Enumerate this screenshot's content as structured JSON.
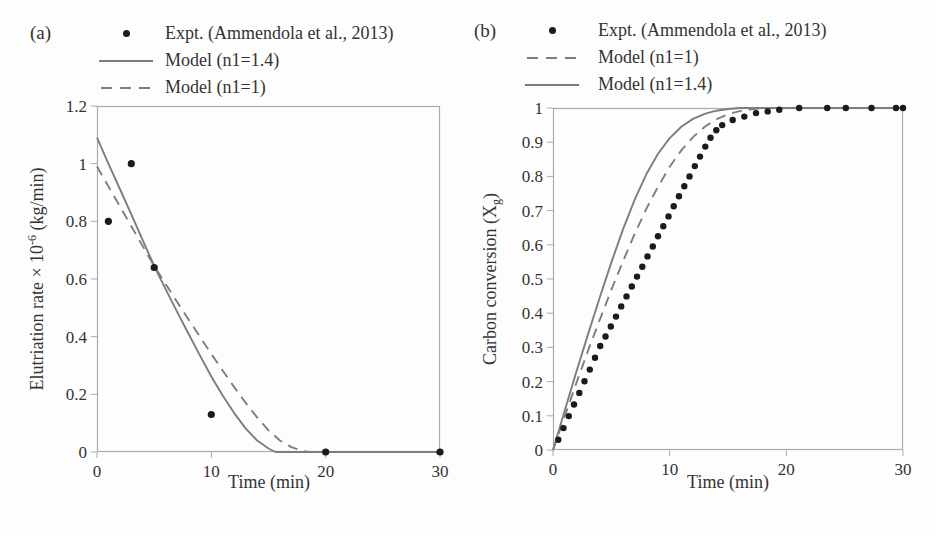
{
  "colors": {
    "model_line_gray": "#7d7d7d",
    "frame_gray": "#ababab",
    "dot_black": "#1b1b1b",
    "text": "#333333",
    "background": "#fdfdfd"
  },
  "panels": [
    {
      "tag": "(a)",
      "xlabel": "Time (min)",
      "ylabel_pre": "Elutriation rate × 10",
      "ylabel_sup": "-6",
      "ylabel_post": " (kg/min)",
      "legend": [
        "Expt. (Ammendola et al., 2013)",
        "Model (n1=1.4)",
        "Model (n1=1)"
      ]
    },
    {
      "tag": "(b)",
      "xlabel": "Time (min)",
      "ylabel_pre": "Carbon conversion (X",
      "ylabel_sub": "g",
      "ylabel_post": ")",
      "legend": [
        "Expt. (Ammendola et al., 2013)",
        "Model (n1=1)",
        "Model (n1=1.4)"
      ]
    }
  ],
  "chart_data": [
    {
      "type": "line",
      "panel": "(a)",
      "xlabel": "Time (min)",
      "ylabel": "Elutriation rate × 10⁻⁶ (kg/min)",
      "xlim": [
        0,
        30
      ],
      "ylim": [
        0,
        1.2
      ],
      "xticks": [
        0,
        10,
        20,
        30
      ],
      "yticks": [
        0,
        0.2,
        0.4,
        0.6,
        0.8,
        1,
        1.2
      ],
      "grid": false,
      "legend_position": "above-top-left",
      "series": [
        {
          "name": "Expt. (Ammendola et al., 2013)",
          "style": "scatter",
          "color": "#1b1b1b",
          "marker_radius": 3.6,
          "points": [
            [
              1,
              0.8
            ],
            [
              3,
              1.0
            ],
            [
              5,
              0.64
            ],
            [
              10,
              0.13
            ],
            [
              20,
              0
            ],
            [
              30,
              0
            ]
          ]
        },
        {
          "name": "Model (n1=1.4)",
          "style": "solid",
          "color": "#7d7d7d",
          "points": [
            [
              0,
              1.09
            ],
            [
              1,
              1.0
            ],
            [
              2,
              0.912
            ],
            [
              3,
              0.824
            ],
            [
              4,
              0.735
            ],
            [
              5,
              0.645
            ],
            [
              6,
              0.565
            ],
            [
              7,
              0.487
            ],
            [
              8,
              0.41
            ],
            [
              9,
              0.335
            ],
            [
              10,
              0.262
            ],
            [
              11,
              0.195
            ],
            [
              12,
              0.135
            ],
            [
              13,
              0.082
            ],
            [
              14,
              0.04
            ],
            [
              15,
              0.012
            ],
            [
              15.6,
              0
            ],
            [
              30,
              0
            ]
          ]
        },
        {
          "name": "Model (n1=1)",
          "style": "dashed",
          "color": "#7d7d7d",
          "points": [
            [
              0,
              0.99
            ],
            [
              1,
              0.921
            ],
            [
              2,
              0.852
            ],
            [
              3,
              0.783
            ],
            [
              4,
              0.714
            ],
            [
              5,
              0.645
            ],
            [
              6,
              0.583
            ],
            [
              7,
              0.521
            ],
            [
              8,
              0.46
            ],
            [
              9,
              0.4
            ],
            [
              10,
              0.34
            ],
            [
              11,
              0.282
            ],
            [
              12,
              0.225
            ],
            [
              13,
              0.171
            ],
            [
              14,
              0.12
            ],
            [
              15,
              0.075
            ],
            [
              16,
              0.04
            ],
            [
              17,
              0.017
            ],
            [
              18,
              0.004
            ],
            [
              18.5,
              0
            ],
            [
              30,
              0
            ]
          ]
        }
      ]
    },
    {
      "type": "line",
      "panel": "(b)",
      "xlabel": "Time (min)",
      "ylabel": "Carbon conversion (Xg)",
      "xlim": [
        0,
        30
      ],
      "ylim": [
        0,
        1
      ],
      "xticks": [
        0,
        10,
        20,
        30
      ],
      "yticks": [
        0,
        0.1,
        0.2,
        0.3,
        0.4,
        0.5,
        0.6,
        0.7,
        0.8,
        0.9,
        1
      ],
      "grid": false,
      "legend_position": "above-top-left",
      "series": [
        {
          "name": "Expt. (Ammendola et al., 2013)",
          "style": "scatter",
          "color": "#1b1b1b",
          "marker_radius": 3.2,
          "points": [
            [
              0.45,
              0.03
            ],
            [
              0.9,
              0.064
            ],
            [
              1.35,
              0.099
            ],
            [
              1.8,
              0.133
            ],
            [
              2.25,
              0.167
            ],
            [
              2.7,
              0.201
            ],
            [
              3.15,
              0.235
            ],
            [
              3.6,
              0.27
            ],
            [
              4.05,
              0.304
            ],
            [
              4.5,
              0.332
            ],
            [
              4.95,
              0.361
            ],
            [
              5.4,
              0.39
            ],
            [
              5.85,
              0.42
            ],
            [
              6.3,
              0.449
            ],
            [
              6.75,
              0.478
            ],
            [
              7.2,
              0.507
            ],
            [
              7.65,
              0.536
            ],
            [
              8.1,
              0.566
            ],
            [
              8.55,
              0.595
            ],
            [
              9,
              0.625
            ],
            [
              9.45,
              0.654
            ],
            [
              9.9,
              0.683
            ],
            [
              10.35,
              0.713
            ],
            [
              10.8,
              0.742
            ],
            [
              11.25,
              0.771
            ],
            [
              11.7,
              0.8
            ],
            [
              12.15,
              0.83
            ],
            [
              12.6,
              0.858
            ],
            [
              13.05,
              0.887
            ],
            [
              13.5,
              0.913
            ],
            [
              14,
              0.935
            ],
            [
              14.5,
              0.95
            ],
            [
              15.4,
              0.965
            ],
            [
              16.4,
              0.975
            ],
            [
              17.4,
              0.985
            ],
            [
              18.4,
              0.99
            ],
            [
              19.4,
              0.995
            ],
            [
              21.1,
              1
            ],
            [
              23.5,
              1
            ],
            [
              25.1,
              1
            ],
            [
              27.3,
              1
            ],
            [
              29.4,
              1
            ],
            [
              30,
              1
            ]
          ]
        },
        {
          "name": "Model (n1=1)",
          "style": "dashed",
          "color": "#7d7d7d",
          "points": [
            [
              0,
              0
            ],
            [
              1,
              0.098
            ],
            [
              2,
              0.195
            ],
            [
              3,
              0.29
            ],
            [
              4,
              0.38
            ],
            [
              5,
              0.468
            ],
            [
              6,
              0.552
            ],
            [
              7,
              0.632
            ],
            [
              8,
              0.705
            ],
            [
              9,
              0.77
            ],
            [
              10,
              0.828
            ],
            [
              11,
              0.876
            ],
            [
              12,
              0.915
            ],
            [
              13,
              0.945
            ],
            [
              14,
              0.967
            ],
            [
              15,
              0.982
            ],
            [
              16,
              0.991
            ],
            [
              17,
              0.996
            ],
            [
              18,
              1
            ],
            [
              30,
              1
            ]
          ]
        },
        {
          "name": "Model (n1=1.4)",
          "style": "solid",
          "color": "#7d7d7d",
          "points": [
            [
              0,
              0
            ],
            [
              1,
              0.115
            ],
            [
              2,
              0.228
            ],
            [
              3,
              0.338
            ],
            [
              4,
              0.445
            ],
            [
              5,
              0.548
            ],
            [
              6,
              0.645
            ],
            [
              7,
              0.732
            ],
            [
              8,
              0.806
            ],
            [
              9,
              0.866
            ],
            [
              10,
              0.912
            ],
            [
              11,
              0.945
            ],
            [
              12,
              0.968
            ],
            [
              13,
              0.983
            ],
            [
              14,
              0.992
            ],
            [
              15,
              0.997
            ],
            [
              16,
              1
            ],
            [
              30,
              1
            ]
          ]
        }
      ]
    }
  ]
}
